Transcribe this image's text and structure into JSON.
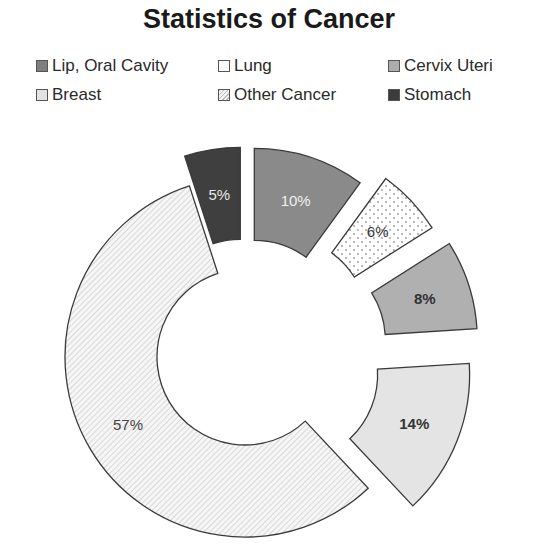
{
  "chart_data": {
    "type": "pie",
    "subtype": "doughnut-exploded",
    "title": "Statistics of Cancer",
    "categories": [
      "Lip, Oral Cavity",
      "Lung",
      "Cervix Uteri",
      "Breast",
      "Other Cancer",
      "Stomach"
    ],
    "values": [
      10,
      6,
      8,
      14,
      57,
      5
    ],
    "labels": [
      "10%",
      "6%",
      "8%",
      "14%",
      "57%",
      "5%"
    ],
    "fills": [
      "#8a8a8a",
      "#ffffff dotted",
      "#b0b0b0",
      "#e2e2e2",
      "#f2f2f2 hatched",
      "#444444"
    ],
    "legend_position": "top"
  },
  "title": "Statistics of Cancer",
  "legend": [
    {
      "label": "Lip, Oral Cavity"
    },
    {
      "label": "Lung"
    },
    {
      "label": "Cervix Uteri"
    },
    {
      "label": "Breast"
    },
    {
      "label": "Other Cancer"
    },
    {
      "label": "Stomach"
    }
  ]
}
